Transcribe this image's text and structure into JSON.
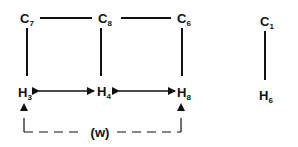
{
  "diagram": {
    "nodes": [
      {
        "id": "C7",
        "base": "C",
        "sub": "7"
      },
      {
        "id": "C8",
        "base": "C",
        "sub": "8"
      },
      {
        "id": "C6",
        "base": "C",
        "sub": "6"
      },
      {
        "id": "C1",
        "base": "C",
        "sub": "1"
      },
      {
        "id": "H3",
        "base": "H",
        "sub": "3"
      },
      {
        "id": "H4",
        "base": "H",
        "sub": "4"
      },
      {
        "id": "H8",
        "base": "H",
        "sub": "8"
      },
      {
        "id": "H6",
        "base": "H",
        "sub": "6"
      }
    ],
    "bonds": [
      {
        "from": "C7",
        "to": "C8"
      },
      {
        "from": "C8",
        "to": "C6"
      },
      {
        "from": "C7",
        "to": "H3"
      },
      {
        "from": "C8",
        "to": "H4"
      },
      {
        "from": "C6",
        "to": "H8"
      },
      {
        "from": "C1",
        "to": "H6"
      }
    ],
    "noe_arrows": [
      {
        "from": "H3",
        "to": "H4",
        "type": "double-headed"
      },
      {
        "from": "H4",
        "to": "H8",
        "type": "double-headed"
      }
    ],
    "weak_interaction": {
      "from": "H3",
      "to": "H8",
      "label": "(w)",
      "style": "dashed"
    }
  }
}
